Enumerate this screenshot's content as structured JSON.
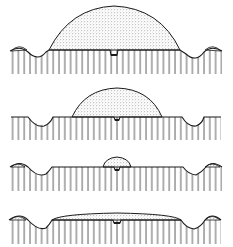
{
  "figure": {
    "colors": {
      "ink": "#1a1a1a",
      "stipple": "#6b6b6b",
      "background": "#ffffff"
    },
    "panels": [
      {
        "id": "panel-1",
        "label": "",
        "top": 0,
        "height": 82,
        "ground_y": 50,
        "dome": {
          "x1": 49,
          "x2": 180,
          "height": 44
        },
        "side_caps": true,
        "center_notch": true
      },
      {
        "id": "panel-2",
        "label": "",
        "top": 84,
        "height": 64,
        "ground_y": 33,
        "dome": {
          "x1": 72,
          "x2": 162,
          "height": 28
        },
        "side_caps": false,
        "center_notch": true
      },
      {
        "id": "panel-3",
        "label": "",
        "top": 150,
        "height": 50,
        "ground_y": 17,
        "dome": {
          "x1": 103,
          "x2": 131,
          "height": 10
        },
        "side_caps": true,
        "center_notch": true
      },
      {
        "id": "panel-4",
        "label": "",
        "top": 200,
        "height": 47,
        "ground_y": 20,
        "dome": {
          "x1": 52,
          "x2": 181,
          "height": 5
        },
        "side_caps": true,
        "center_notch": true
      }
    ]
  }
}
